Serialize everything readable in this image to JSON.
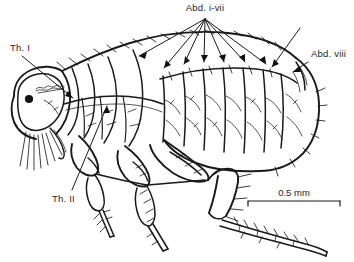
{
  "figure": {
    "view": "lateral",
    "background_color": "#ffffff",
    "ink_color": "#1a1a1a",
    "width": 354,
    "height": 262
  },
  "labels": [
    {
      "id": "abd-i-vii",
      "text": "Abd. i-vii",
      "x": 205,
      "y": 11,
      "anchor": "middle",
      "meaning": "abdominal segments one through seven",
      "leader_count": 7
    },
    {
      "id": "abd-viii",
      "text": "Abd. viii",
      "x": 311,
      "y": 57,
      "anchor": "start",
      "meaning": "abdominal segment eight",
      "leader_count": 2
    },
    {
      "id": "th-i",
      "text": "Th. I",
      "x": 10,
      "y": 51,
      "anchor": "start",
      "meaning": "prothorax",
      "leader_count": 1
    },
    {
      "id": "th-ii",
      "text": "Th. II",
      "x": 52,
      "y": 202,
      "anchor": "start",
      "meaning": "mesothorax",
      "leader_count": 1
    }
  ],
  "scale_bar": {
    "text": "0.5 mm",
    "text_x": 294,
    "text_y": 196,
    "line_y": 201,
    "x_start": 248,
    "x_end": 340,
    "tick_height": 5,
    "units": "mm",
    "value": 0.5
  },
  "anatomy": {
    "eye_spot": {
      "cx": 29,
      "cy": 99,
      "r": 4.1,
      "color": "#111111"
    },
    "regions": [
      "head",
      "prothorax",
      "mesothorax",
      "metathorax",
      "abdominal segments i-vii",
      "abdominal segment viii",
      "foreleg",
      "midleg",
      "hindleg",
      "mouthparts"
    ]
  }
}
